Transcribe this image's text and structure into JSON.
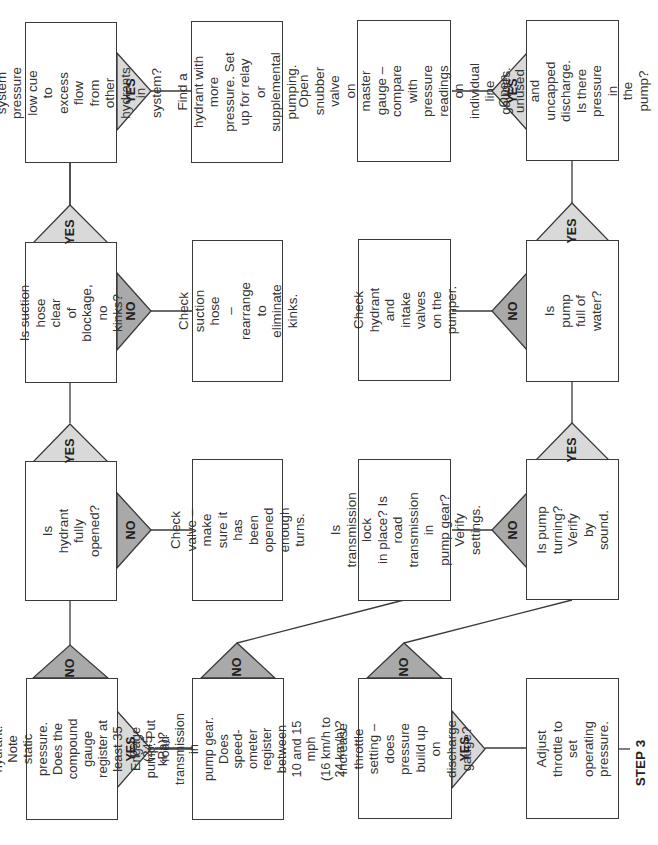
{
  "diagram": {
    "orientation": "rotated 90° counter-clockwise",
    "step_label": "STEP 3",
    "colors": {
      "yes_fill": "#d9d9d9",
      "no_fill": "#a9a9a9",
      "stroke": "#3a3a3a",
      "text": "#333333"
    },
    "decisions": {
      "open_hydrant": "Open the hydrant.\nNote static pressure.\nDoes the compound\ngauge register at\nleast 35 psi\n(245 kPa)?",
      "hydrant_fully_opened": "Is hydrant fully\nopened?",
      "suction_hose_clear": "Is suction hose clear\nof blockage, no\nkinks?",
      "system_pressure_low": "Is system pressure\nlow cue to excess\nflow from other\nhydrants in system?",
      "engage_pump": "Engage pump. Put\nroad transmission in\npump gear. Does speed-\nometer register between\n10 and 15 mph\n(16 km/h to 24 km/h)?",
      "increase_throttle": "Increase throttle\nsetting – does\npressure build up on\ndischarge gauge?",
      "pump_turning": "Is pump turning?\nVerify by sound.",
      "pump_full_of_water": "Is pump full of\nwater?",
      "open_unused_discharge": "Open unused and\nuncapped discharge.\nIs there pressure in\nthe pump?"
    },
    "actions": {
      "check_valve": "Check valve – make\nsure it has been\nopened enough\nturns.",
      "check_suction_hose": "Check suction hose\n– rearrange to\neliminate kinks.",
      "find_hydrant": "Find a hydrant with\nmore pressure. Set\nup for relay or\nsupplemental\npumping.",
      "transmission_lock": "Is transmission lock\nin place? Is road\ntransmission in\npump gear? Verify\nsettings.",
      "check_intake_valves": "Check hydrant and\nintake valves on the\npumper.",
      "open_snubber_valve": "Open snubber valve\non master gauge –\ncompare with\npressure readings on\nindividual line\ngauges.",
      "adjust_throttle": "Adjust throttle to set\noperating pressure."
    },
    "branch_labels": {
      "yes": "YES",
      "no": "NO"
    }
  }
}
